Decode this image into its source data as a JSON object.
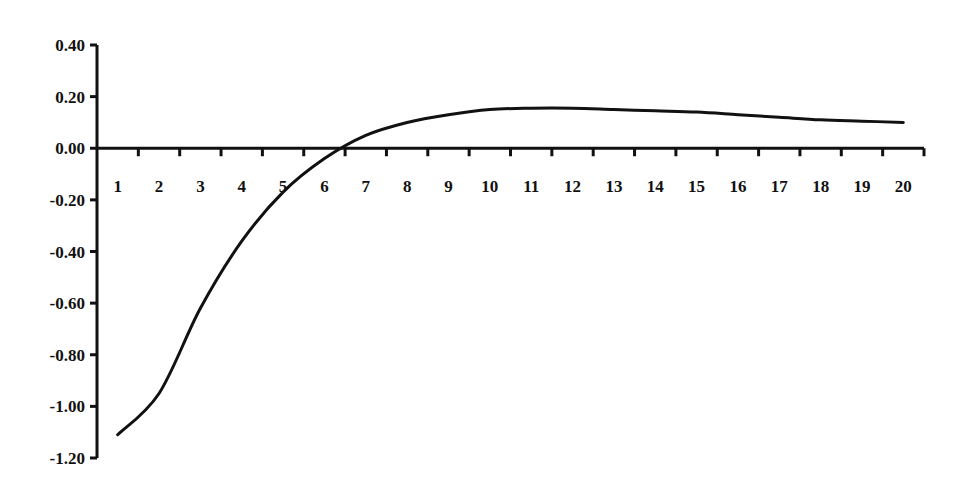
{
  "chart_data": {
    "type": "line",
    "title": "",
    "xlabel": "",
    "ylabel": "",
    "categories": [
      "1",
      "2",
      "3",
      "4",
      "5",
      "6",
      "7",
      "8",
      "9",
      "10",
      "11",
      "12",
      "13",
      "14",
      "15",
      "16",
      "17",
      "18",
      "19",
      "20"
    ],
    "series": [
      {
        "name": "series-1",
        "values": [
          -1.11,
          -0.95,
          -0.62,
          -0.36,
          -0.17,
          -0.04,
          0.05,
          0.1,
          0.13,
          0.15,
          0.155,
          0.155,
          0.15,
          0.145,
          0.14,
          0.13,
          0.12,
          0.11,
          0.105,
          0.1
        ]
      }
    ],
    "yticks": [
      "0.40",
      "0.20",
      "0.00",
      "-0.20",
      "-0.40",
      "-0.60",
      "-0.80",
      "-1.00",
      "-1.20"
    ],
    "ytick_values": [
      0.4,
      0.2,
      0.0,
      -0.2,
      -0.4,
      -0.6,
      -0.8,
      -1.0,
      -1.2
    ],
    "ylim": [
      -1.2,
      0.4
    ],
    "grid": false,
    "legend": null,
    "line_color": "#111111"
  }
}
